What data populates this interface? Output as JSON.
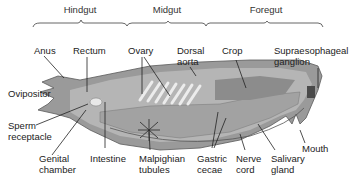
{
  "sections": [
    {
      "label": "Hindgut",
      "x": 80
    },
    {
      "label": "Midgut",
      "x": 167
    },
    {
      "label": "Foregut",
      "x": 266
    }
  ],
  "labels": {
    "anus": "Anus",
    "rectum": "Rectum",
    "ovary": "Ovary",
    "dorsal_aorta": "Dorsal\naorta",
    "crop": "Crop",
    "supraesophageal_ganglion": "Supraesophageal\nganglion",
    "ovipositor": "Ovipositor",
    "sperm_receptacle": "Sperm\nreceptacle",
    "genital_chamber": "Genital\nchamber",
    "intestine": "Intestine",
    "malpighian_tubules": "Malpighian\ntubules",
    "gastric_cecae": "Gastric\ncecae",
    "nerve_cord": "Nerve\ncord",
    "salivary_gland": "Salivary\ngland",
    "mouth": "Mouth"
  },
  "colors": {
    "body_outer": "#9a9a9a",
    "body_inner": "#bdbdbd",
    "body_dark": "#6e6e6e",
    "ovary_stripes": "#e6e6e6",
    "leader_line": "#222222",
    "bracket": "#555555"
  }
}
